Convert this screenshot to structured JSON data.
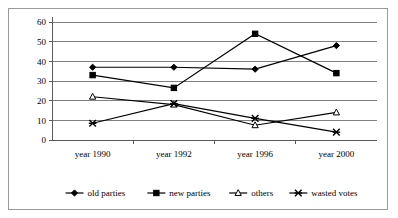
{
  "chart_data": {
    "type": "line",
    "title": "",
    "xlabel": "",
    "ylabel": "",
    "categories": [
      "year 1990",
      "year 1992",
      "year 1996",
      "year 2000"
    ],
    "ylim": [
      0,
      60
    ],
    "yticks": [
      0,
      10,
      20,
      30,
      40,
      50,
      60
    ],
    "grid": true,
    "legend_position": "bottom",
    "series": [
      {
        "name": "old parties",
        "marker": "filled-diamond",
        "values": [
          37,
          37,
          36,
          48
        ]
      },
      {
        "name": "new parties",
        "marker": "filled-square",
        "values": [
          33,
          26.5,
          54,
          34
        ]
      },
      {
        "name": "others",
        "marker": "open-triangle",
        "values": [
          22,
          18,
          7.5,
          14
        ]
      },
      {
        "name": "wasted votes",
        "marker": "cross-x",
        "values": [
          8.5,
          18.5,
          11,
          4
        ]
      }
    ]
  },
  "legend": {
    "entries": [
      {
        "label": "old parties",
        "marker": "filled-diamond"
      },
      {
        "label": "new parties",
        "marker": "filled-square"
      },
      {
        "label": "others",
        "marker": "open-triangle"
      },
      {
        "label": "wasted votes",
        "marker": "cross-x"
      }
    ]
  },
  "axis": {
    "y_tick_labels": [
      "60",
      "50",
      "40",
      "30",
      "20",
      "10",
      "0"
    ],
    "x_tick_labels": [
      "year 1990",
      "year 1992",
      "year 1996",
      "year 2000"
    ]
  }
}
